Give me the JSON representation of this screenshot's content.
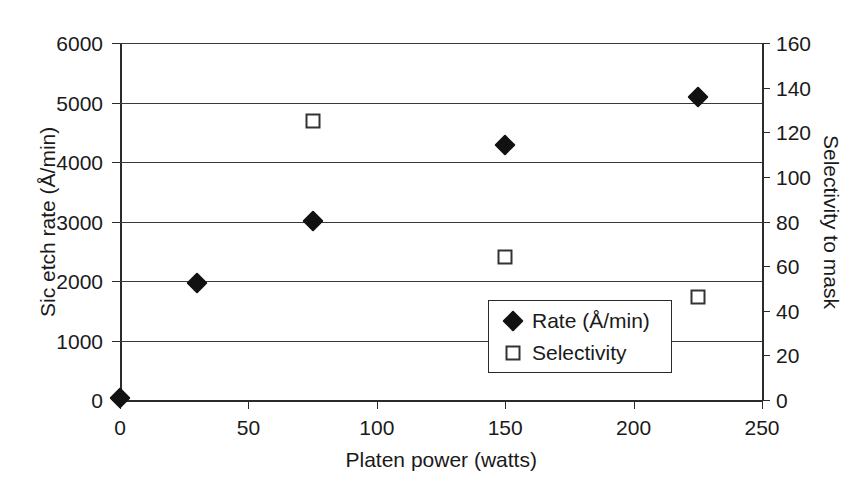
{
  "chart_data": {
    "type": "scatter",
    "title": "",
    "xlabel": "Platen power (watts)",
    "ylabel": "Sic etch rate (Å/min)",
    "y2label": "Selectivity to mask",
    "xlim": [
      0,
      250
    ],
    "ylim": [
      0,
      6000
    ],
    "y2lim": [
      0,
      160
    ],
    "xticks": [
      0,
      50,
      100,
      150,
      200,
      250
    ],
    "yticks": [
      0,
      1000,
      2000,
      3000,
      4000,
      5000,
      6000
    ],
    "y2ticks": [
      0,
      20,
      40,
      60,
      80,
      100,
      120,
      140,
      160
    ],
    "xticklabels": [
      "0",
      "50",
      "100",
      "150",
      "200",
      "250"
    ],
    "yticklabels": [
      "0",
      "1000",
      "2000",
      "3000",
      "4000",
      "5000",
      "6000"
    ],
    "y2ticklabels": [
      "0",
      "20",
      "40",
      "60",
      "80",
      "100",
      "120",
      "140",
      "160"
    ],
    "grid": "horizontal",
    "gridlines_y": [
      1000,
      2000,
      3000,
      4000,
      5000,
      6000
    ],
    "legend_position": "lower-center-right",
    "series": [
      {
        "name": "Rate (Å/min)",
        "axis": "left",
        "marker": "filled-diamond",
        "color": "#111111",
        "x": [
          0,
          30,
          75,
          150,
          225
        ],
        "values": [
          30,
          1960,
          3010,
          4290,
          5100
        ]
      },
      {
        "name": "Selectivity",
        "axis": "right",
        "marker": "open-square",
        "color": "#333333",
        "x": [
          75,
          150,
          225
        ],
        "values": [
          125,
          64,
          46
        ]
      }
    ]
  },
  "legend": {
    "items": [
      {
        "label": "Rate (Å/min)",
        "marker": "filled-diamond"
      },
      {
        "label": "Selectivity",
        "marker": "open-square"
      }
    ]
  }
}
